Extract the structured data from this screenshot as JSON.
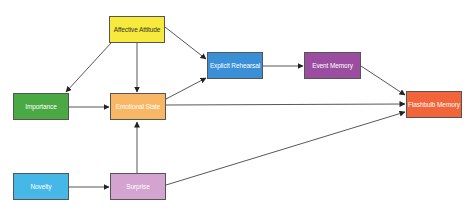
{
  "nodes": {
    "affective_attitude": {
      "label": "Affective Attitude",
      "color": "#f7ea3c"
    },
    "importance": {
      "label": "Importance",
      "color": "#4aa942"
    },
    "emotional_state": {
      "label": "Emotional State",
      "color": "#f7b764"
    },
    "explicit_rehearsal": {
      "label": "Explicit Rehearsal",
      "color": "#3a8fd6"
    },
    "event_memory": {
      "label": "Event Memory",
      "color": "#9b4ea0"
    },
    "flashbulb_memory": {
      "label": "Flashbulb Memory",
      "color": "#f2653a"
    },
    "novelty": {
      "label": "Novelty",
      "color": "#45b8e8"
    },
    "surprise": {
      "label": "Surprise",
      "color": "#d4a3d0"
    }
  },
  "edges": [
    {
      "from": "Affective Attitude",
      "to": "Importance"
    },
    {
      "from": "Affective Attitude",
      "to": "Emotional State"
    },
    {
      "from": "Affective Attitude",
      "to": "Explicit Rehearsal"
    },
    {
      "from": "Importance",
      "to": "Emotional State"
    },
    {
      "from": "Emotional State",
      "to": "Explicit Rehearsal"
    },
    {
      "from": "Emotional State",
      "to": "Flashbulb Memory"
    },
    {
      "from": "Explicit Rehearsal",
      "to": "Event Memory"
    },
    {
      "from": "Event Memory",
      "to": "Flashbulb Memory"
    },
    {
      "from": "Novelty",
      "to": "Surprise"
    },
    {
      "from": "Surprise",
      "to": "Emotional State"
    },
    {
      "from": "Surprise",
      "to": "Flashbulb Memory"
    }
  ]
}
